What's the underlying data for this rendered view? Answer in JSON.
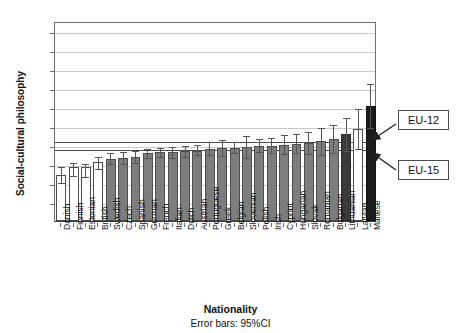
{
  "chart_data": {
    "type": "bar",
    "title": "",
    "xlabel": "Nationality",
    "ylabel": "Social-cultural philosophy",
    "caption": "Error bars: 95%CI",
    "ylim": [
      0,
      10.5
    ],
    "yticks": [
      1,
      2,
      3,
      4,
      5,
      6,
      7,
      8,
      9,
      10
    ],
    "grid": true,
    "legend": "none",
    "categories": [
      "Danish",
      "Finnish",
      "Estonian",
      "British",
      "Swedish",
      "Czech",
      "Spanish",
      "German",
      "French",
      "Italian",
      "Dutch",
      "Austrian",
      "Portuguese",
      "Greek",
      "Belgian",
      "Slovenian",
      "Polish",
      "Irish",
      "Cypriot",
      "Hungarian",
      "Slovak",
      "Romanian",
      "Bulgarian",
      "Lithuanian",
      "Latvian",
      "Maltese"
    ],
    "values": [
      2.4,
      2.85,
      2.85,
      3.1,
      3.25,
      3.3,
      3.35,
      3.55,
      3.6,
      3.6,
      3.65,
      3.7,
      3.8,
      3.85,
      3.85,
      3.9,
      3.95,
      3.95,
      4.0,
      4.05,
      4.1,
      4.2,
      4.3,
      4.55,
      4.85,
      6.05
    ],
    "ci_low": [
      2.0,
      2.35,
      2.3,
      2.75,
      3.0,
      3.0,
      3.05,
      3.3,
      3.35,
      3.3,
      3.35,
      3.45,
      3.45,
      3.4,
      3.55,
      3.3,
      3.6,
      3.55,
      3.5,
      3.55,
      3.5,
      3.45,
      3.55,
      3.7,
      3.8,
      4.9
    ],
    "ci_high": [
      2.85,
      3.05,
      3.0,
      3.35,
      3.55,
      3.6,
      3.65,
      3.8,
      3.85,
      3.9,
      3.95,
      4.0,
      4.15,
      4.25,
      4.15,
      4.45,
      4.3,
      4.35,
      4.5,
      4.55,
      4.65,
      4.9,
      5.05,
      5.4,
      5.9,
      7.2
    ],
    "bar_styles": [
      "white",
      "white",
      "white",
      "white",
      "gray",
      "gray",
      "gray",
      "gray",
      "gray",
      "gray",
      "gray",
      "gray",
      "gray",
      "gray",
      "gray",
      "gray",
      "gray",
      "gray",
      "gray",
      "gray",
      "gray",
      "gray",
      "gray",
      "dark",
      "white",
      "black"
    ],
    "reference_lines": [
      {
        "label": "EU-12",
        "value": 4.25
      },
      {
        "label": "EU-15",
        "value": 3.85
      }
    ],
    "colors": {
      "bar_white": "#ffffff",
      "bar_gray": "#7d7d7d",
      "bar_dark": "#3a3a3a",
      "bar_black": "#1c1c1c",
      "error_bar": "#555555",
      "gridline": "#c9c9c9",
      "reference_line": "#4a4a4a",
      "axis": "#6e6e6e"
    }
  }
}
